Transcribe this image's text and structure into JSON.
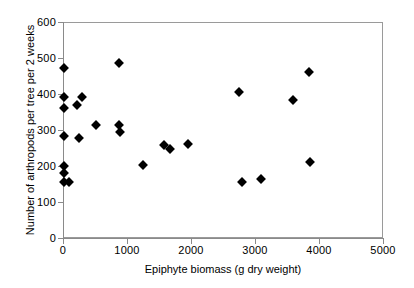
{
  "chart_data": {
    "type": "scatter",
    "title": "",
    "xlabel": "Epiphyte biomass (g dry weight)",
    "ylabel": "Number of arthropods per tree per 2 weeks",
    "xlim": [
      0,
      5000
    ],
    "ylim": [
      0,
      600
    ],
    "xticks": [
      0,
      1000,
      2000,
      3000,
      4000,
      5000
    ],
    "yticks": [
      0,
      100,
      200,
      300,
      400,
      500,
      600
    ],
    "xtick_labels": [
      "0",
      "1000",
      "2000",
      "3000",
      "4000",
      "5000"
    ],
    "ytick_labels": [
      "0",
      "100",
      "200",
      "300",
      "400",
      "500",
      "600"
    ],
    "grid": false,
    "legend": false,
    "marker": "diamond",
    "marker_color": "#000000",
    "series": [
      {
        "name": "Arthropods vs epiphyte biomass",
        "points": [
          {
            "x": 20,
            "y": 472
          },
          {
            "x": 20,
            "y": 393
          },
          {
            "x": 20,
            "y": 362
          },
          {
            "x": 20,
            "y": 283
          },
          {
            "x": 20,
            "y": 200
          },
          {
            "x": 20,
            "y": 180
          },
          {
            "x": 20,
            "y": 157
          },
          {
            "x": 90,
            "y": 156
          },
          {
            "x": 225,
            "y": 369
          },
          {
            "x": 290,
            "y": 393
          },
          {
            "x": 250,
            "y": 277
          },
          {
            "x": 515,
            "y": 315
          },
          {
            "x": 880,
            "y": 485
          },
          {
            "x": 880,
            "y": 314
          },
          {
            "x": 885,
            "y": 295
          },
          {
            "x": 1245,
            "y": 203
          },
          {
            "x": 1570,
            "y": 258
          },
          {
            "x": 1665,
            "y": 248
          },
          {
            "x": 1950,
            "y": 262
          },
          {
            "x": 2750,
            "y": 406
          },
          {
            "x": 2800,
            "y": 157
          },
          {
            "x": 3095,
            "y": 164
          },
          {
            "x": 3600,
            "y": 384
          },
          {
            "x": 3850,
            "y": 460
          },
          {
            "x": 3855,
            "y": 212
          }
        ]
      }
    ]
  }
}
